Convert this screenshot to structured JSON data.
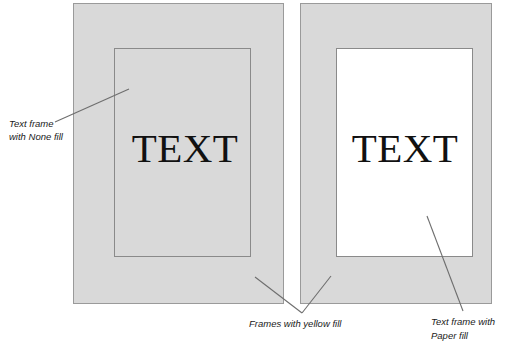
{
  "figure": {
    "background_color": "#ffffff",
    "frame_fill_color": "#d9d9d9",
    "paper_fill_color": "#ffffff",
    "frame_border_color": "#9a9a9a",
    "leader_line_color": "#6e6e6e"
  },
  "panels": {
    "left": {
      "name": "left-frame-yellow-fill",
      "inner_frame_fill": "None",
      "sample_text": "TEXT"
    },
    "right": {
      "name": "right-frame-yellow-fill",
      "inner_frame_fill": "Paper",
      "sample_text": "TEXT"
    }
  },
  "callouts": {
    "none_fill": {
      "line1": "Text frame",
      "line2": "with None fill"
    },
    "yellow_fill": {
      "line1": "Frames with yellow fill"
    },
    "paper_fill": {
      "line1": "Text frame with",
      "line2": "Paper fill"
    }
  }
}
